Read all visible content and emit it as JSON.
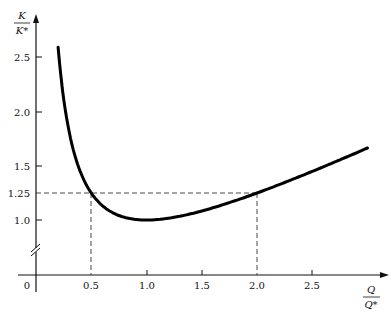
{
  "chart_data": {
    "type": "line",
    "title": "",
    "xlabel": {
      "numerator": "Q",
      "denominator": "Q*"
    },
    "ylabel": {
      "numerator": "K",
      "denominator": "K*"
    },
    "x_ticks": [
      "0.5",
      "1.0",
      "1.5",
      "2.0",
      "2.5"
    ],
    "x_tick_values": [
      0.5,
      1.0,
      1.5,
      2.0,
      2.5
    ],
    "origin_label": "0",
    "y_ticks": [
      "1.0",
      "1.25",
      "1.5",
      "2.0",
      "2.5"
    ],
    "y_tick_values": [
      1.0,
      1.25,
      1.5,
      2.0,
      2.5
    ],
    "xlim": [
      0,
      3.2
    ],
    "ylim": [
      1.0,
      2.65
    ],
    "y_axis_break": true,
    "grid": false,
    "legend": null,
    "series": [
      {
        "name": "K/K* = ½(Q/Q* + Q*/Q)",
        "x": [
          0.2,
          0.25,
          0.3,
          0.4,
          0.5,
          0.6,
          0.7,
          0.8,
          0.9,
          1.0,
          1.2,
          1.4,
          1.6,
          1.8,
          2.0,
          2.2,
          2.4,
          2.6,
          2.8,
          3.0
        ],
        "values": [
          2.6,
          2.125,
          1.817,
          1.45,
          1.25,
          1.133,
          1.064,
          1.025,
          1.006,
          1.0,
          1.017,
          1.057,
          1.113,
          1.178,
          1.25,
          1.327,
          1.408,
          1.492,
          1.579,
          1.667
        ]
      }
    ],
    "annotations": [
      {
        "type": "dashed-hline",
        "y": 1.25,
        "x_from": 0,
        "x_to": 2.0
      },
      {
        "type": "dashed-vline",
        "x": 0.5,
        "y_from": 1.25,
        "y_to": "x-axis"
      },
      {
        "type": "dashed-vline",
        "x": 2.0,
        "y_from": 1.25,
        "y_to": "x-axis"
      }
    ]
  }
}
